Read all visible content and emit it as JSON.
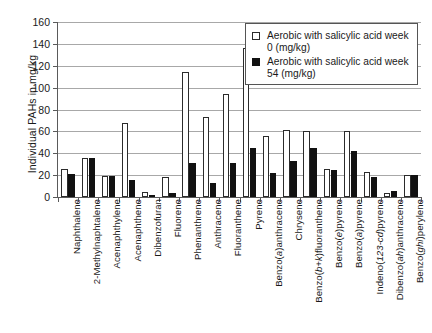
{
  "chart_data": {
    "type": "bar",
    "title": "",
    "xlabel": "",
    "ylabel": "Individual PAHs in mg/kg",
    "ylim": [
      0,
      160
    ],
    "yticks": [
      0,
      20,
      40,
      60,
      80,
      100,
      120,
      140,
      160
    ],
    "grid": true,
    "legend_position": "top-right",
    "categories": [
      "Naphthalene",
      "2-Methylnaphtalene",
      "Acenaphthylene",
      "Acenaphthene",
      "Dibenzofuran",
      "Fluorene",
      "Phenanthrene",
      "Anthracene",
      "Fluoranthene",
      "Pyrene",
      "Benzo(a)anthracene",
      "Chrysene",
      "Benzo(b+k)fluoranthene",
      "Benzo(e)pyrene",
      "Benzo(a)pyrene",
      "Indeno(123-cd)pyrene",
      "Dibenzo(ah)anthracene",
      "Benzo(ghi)perylene"
    ],
    "series": [
      {
        "name": "Aerobic with salicylic acid week 0 (mg/kg)",
        "color": "#ffffff",
        "edge_color": "#2b2b2b",
        "values": [
          26,
          36,
          19.5,
          68,
          4.5,
          18.5,
          114,
          73,
          94,
          136,
          56,
          61,
          60,
          25.5,
          60,
          23,
          3.5,
          20
        ]
      },
      {
        "name": "Aerobic with salicylic acid week 54 (mg/kg)",
        "color": "#111111",
        "edge_color": "#111111",
        "values": [
          21,
          36,
          19,
          16,
          1.5,
          3.5,
          31,
          12.5,
          31,
          45,
          21.5,
          33,
          45,
          25,
          42,
          18.5,
          5.5,
          20
        ]
      }
    ]
  },
  "legend": {
    "entries": [
      {
        "swatch": "open-square-icon",
        "label": "Aerobic with salicylic acid week 0 (mg/kg)"
      },
      {
        "swatch": "filled-square-icon",
        "label": "Aerobic with salicylic acid week 54 (mg/kg)"
      }
    ]
  },
  "axis": {
    "y_title": "Individual PAHs in mg/kg"
  }
}
